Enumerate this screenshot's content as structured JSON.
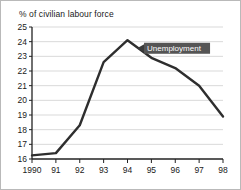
{
  "chart_data": {
    "type": "line",
    "title": "% of civilian labour force",
    "xlabel": "",
    "ylabel": "",
    "ylim": [
      16,
      25
    ],
    "xlim": [
      1990,
      1998
    ],
    "grid": true,
    "legend_position": "none",
    "categories": [
      "1990",
      "91",
      "92",
      "93",
      "94",
      "95",
      "96",
      "97",
      "98"
    ],
    "x": [
      1990,
      1991,
      1992,
      1993,
      1994,
      1995,
      1996,
      1997,
      1998
    ],
    "ytick_labels": [
      "25",
      "24",
      "23",
      "22",
      "21",
      "20",
      "19",
      "18",
      "17",
      "16"
    ],
    "ytick_values": [
      25,
      24,
      23,
      22,
      21,
      20,
      19,
      18,
      17,
      16
    ],
    "series": [
      {
        "name": "Unemployment",
        "values": [
          16.25,
          16.4,
          18.3,
          22.6,
          24.1,
          22.9,
          22.2,
          21.0,
          18.9
        ]
      }
    ],
    "annotations": [
      {
        "text": "Unemployment",
        "target_x": 1994.4,
        "target_y": 23.55
      }
    ],
    "colors": {
      "line": "#2e2e2e",
      "grid": "#c8c8c8",
      "axis": "#222222",
      "annotation_box": "#555555",
      "annotation_text": "#ffffff",
      "background": "#ffffff",
      "frame_border": "#b9b9b9"
    }
  }
}
